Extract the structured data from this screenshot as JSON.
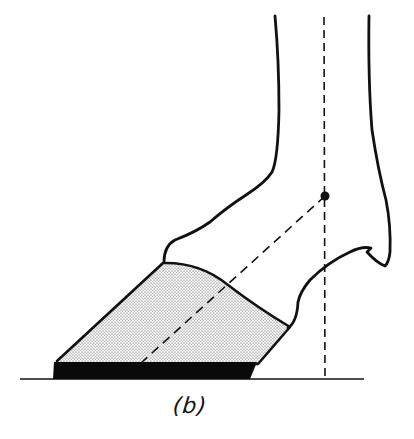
{
  "figure": {
    "caption": "(b)",
    "colors": {
      "line": "#111111",
      "hoof_fill": "#d9d9d9",
      "sole": "#0a0a0a",
      "background": "#ffffff"
    },
    "elements": {
      "leg_outline": "leg-outline",
      "hoof_wall": "hoof-wall-stippled",
      "sole": "shoe-sole-bar",
      "ground_line": "ground-line",
      "vertical_axis": "vertical-dashed-line",
      "pastern_axis": "diagonal-dashed-line",
      "pivot_point": "joint-center-dot"
    }
  }
}
